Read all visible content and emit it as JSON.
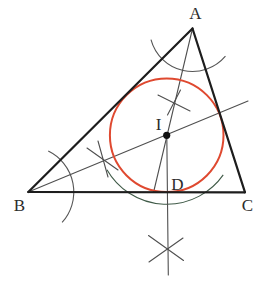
{
  "diagram": {
    "canvas": {
      "width": 275,
      "height": 289,
      "background": "#ffffff"
    },
    "colors": {
      "triangle": "#1d1d1d",
      "construction": "#4f4f4f",
      "tick": "#4f4f4f",
      "arc_gray": "#555555",
      "arc_green": "#3f5a47",
      "incircle": "#df4930",
      "dot": "#111111",
      "label": "#2b2b2b"
    },
    "points": {
      "A": {
        "x": 192.5,
        "y": 28.5
      },
      "B": {
        "x": 28.3,
        "y": 192
      },
      "C": {
        "x": 245,
        "y": 192.3
      },
      "I": {
        "x": 166.7,
        "y": 135.3
      },
      "D": {
        "x": 167.2,
        "y": 192.3
      }
    },
    "labels": [
      {
        "name": "vertex-label-a",
        "text": "A",
        "x": 195.5,
        "y": 19
      },
      {
        "name": "vertex-label-b",
        "text": "B",
        "x": 19.5,
        "y": 210.5
      },
      {
        "name": "vertex-label-c",
        "text": "C",
        "x": 247.5,
        "y": 210.5
      },
      {
        "name": "incenter-label-i",
        "text": "I",
        "x": 158.5,
        "y": 130
      },
      {
        "name": "foot-label-d",
        "text": "D",
        "x": 177.5,
        "y": 190
      }
    ],
    "triangle_sides": [
      {
        "name": "triangle-side-ab",
        "x1": 192.5,
        "y1": 28.5,
        "x2": 28.3,
        "y2": 192
      },
      {
        "name": "triangle-side-bc",
        "x1": 28.3,
        "y1": 192,
        "x2": 245,
        "y2": 192.3
      },
      {
        "name": "triangle-side-ca",
        "x1": 245,
        "y1": 192.3,
        "x2": 192.5,
        "y2": 28.5
      }
    ],
    "construction_lines": [
      {
        "name": "angle-bisector-from-a",
        "x1": 192.5,
        "y1": 28.5,
        "x2": 153.5,
        "y2": 192.5
      },
      {
        "name": "angle-bisector-from-b",
        "x1": 28.3,
        "y1": 192,
        "x2": 248,
        "y2": 101
      },
      {
        "name": "perpendicular-from-i",
        "x1": 166.8,
        "y1": 135.3,
        "x2": 168.3,
        "y2": 275
      }
    ],
    "arcs": [
      {
        "name": "angle-arc-at-a",
        "cx": 192.5,
        "cy": 28.5,
        "r": 43,
        "start_deg": 40,
        "end_deg": 165,
        "color_key": "arc_gray"
      },
      {
        "name": "angle-arc-at-b",
        "cx": 28.3,
        "cy": 192,
        "r": 45.5,
        "start_deg": -64,
        "end_deg": 42,
        "color_key": "arc_gray"
      },
      {
        "name": "arc-below-bc",
        "cx": 166.7,
        "cy": 135.3,
        "r": 69,
        "start_deg": 35,
        "end_deg": 150,
        "color_key": "arc_green"
      }
    ],
    "tick_marks": [
      {
        "name": "tick-cross-on-a-bisector-1",
        "x1": 158,
        "y1": 95,
        "x2": 190,
        "y2": 111
      },
      {
        "name": "tick-cross-on-a-bisector-2",
        "x1": 180.5,
        "y1": 90,
        "x2": 167.5,
        "y2": 115
      },
      {
        "name": "tick-cross-on-b-bisector-1",
        "x1": 87,
        "y1": 148,
        "x2": 118,
        "y2": 170
      },
      {
        "name": "tick-cross-on-b-bisector-2",
        "x1": 98,
        "y1": 141,
        "x2": 108,
        "y2": 177
      },
      {
        "name": "tick-cross-below-bc-1",
        "x1": 148.5,
        "y1": 235.5,
        "x2": 183.5,
        "y2": 260.5
      },
      {
        "name": "tick-cross-below-bc-2",
        "x1": 183,
        "y1": 238,
        "x2": 149,
        "y2": 262
      }
    ],
    "incircle": {
      "cx": 166.7,
      "cy": 135.3,
      "r": 56.8
    },
    "incenter_dot": {
      "cx": 166.7,
      "cy": 135.3,
      "r": 3.6
    },
    "stroke_widths": {
      "triangle": 2.2,
      "incircle": 2,
      "construction": 1.1,
      "arc": 1.1,
      "tick": 1.1
    }
  }
}
